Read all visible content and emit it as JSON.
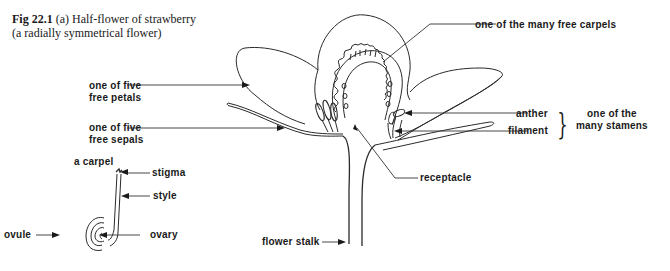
{
  "caption": {
    "figure_number": "Fig 22.1",
    "line1_rest": " (a) Half-flower of strawberry",
    "line2": "(a radially symmetrical flower)"
  },
  "flower_labels": {
    "petal": [
      "one of five",
      "free petals"
    ],
    "sepal": [
      "one of five",
      "free sepals"
    ],
    "carpel": "one of the many free carpels",
    "anther": "anther",
    "filament": "filament",
    "stamen_group": [
      "one of the",
      "many stamens"
    ],
    "receptacle": "receptacle",
    "flower_stalk": "flower stalk"
  },
  "carpel_labels": {
    "title": "a carpel",
    "stigma": "stigma",
    "style": "style",
    "ovary": "ovary",
    "ovule": "ovule"
  },
  "brace_glyph": "}"
}
